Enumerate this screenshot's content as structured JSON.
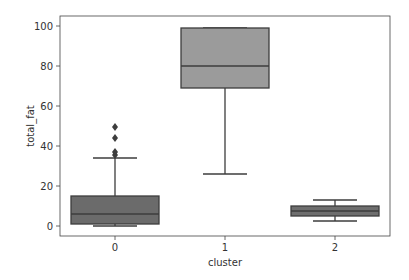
{
  "chart_data": {
    "type": "box",
    "title": "",
    "xlabel": "cluster",
    "ylabel": "total_fat",
    "categories": [
      "0",
      "1",
      "2"
    ],
    "yticks": [
      0,
      20,
      40,
      60,
      80,
      100
    ],
    "ylim": [
      -2,
      105
    ],
    "grid": false,
    "legend": null,
    "boxes": [
      {
        "category": "0",
        "whisker_low": 0,
        "q1": 1,
        "median": 6,
        "q3": 15,
        "whisker_high": 34,
        "outliers": [
          35.5,
          37,
          44,
          49.5
        ],
        "color": "#6b6b6b"
      },
      {
        "category": "1",
        "whisker_low": 26,
        "q1": 69,
        "median": 80,
        "q3": 99,
        "whisker_high": 99,
        "outliers": [],
        "color": "#9b9b9b"
      },
      {
        "category": "2",
        "whisker_low": 2.5,
        "q1": 5,
        "median": 7.5,
        "q3": 10,
        "whisker_high": 13,
        "outliers": [],
        "color": "#6e6e6e"
      }
    ]
  }
}
